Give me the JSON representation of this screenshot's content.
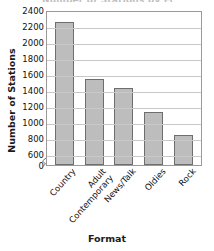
{
  "chart_data": {
    "type": "bar",
    "title": "",
    "title_fragment": "Number of Stations by Format",
    "categories": [
      "Country",
      "Adult\nContemporary",
      "News/Talk",
      "Oldies",
      "Rock"
    ],
    "category_plain": [
      "Country",
      "Adult Contemporary",
      "News/Talk",
      "Oldies",
      "Rock"
    ],
    "values": [
      2250,
      1540,
      1430,
      1130,
      840
    ],
    "xlabel": "Format",
    "ylabel": "Number of Stations",
    "ylim": [
      600,
      2400
    ],
    "y_axis_break": true,
    "y_break_low": 0,
    "yticks": [
      2400,
      2200,
      2000,
      1800,
      1600,
      1400,
      1200,
      1000,
      800,
      600,
      0
    ],
    "grid": true,
    "legend": "none",
    "bar_color": "#bdbdbd",
    "bar_border_color": "#6e6e6e",
    "grid_color": "#c9c9c9",
    "frame_color": "#9a9a9a"
  }
}
